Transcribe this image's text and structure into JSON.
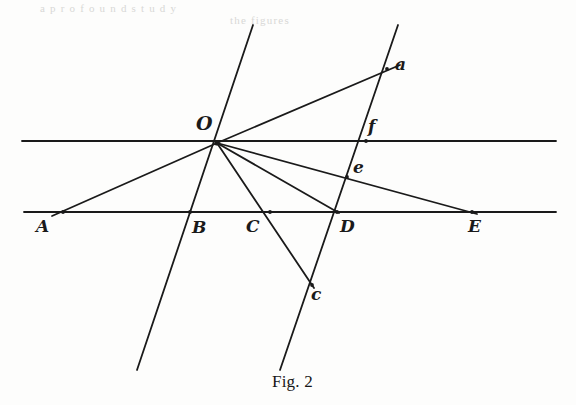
{
  "figure": {
    "caption": "Fig. 2",
    "caption_x": 272,
    "caption_y": 372,
    "width": 576,
    "height": 405,
    "background_color": "#fdfdfc",
    "ink_color": "#1a1a1a",
    "stroke_width": 1.8
  },
  "bleed_text": {
    "line1": "a  p  r  o  f  o  u  n  d     s  t  u  d  y",
    "line1_x": 40,
    "line1_y": 2,
    "line2": "the  figures",
    "line2_x": 230,
    "line2_y": 14
  },
  "points": [
    {
      "name": "O",
      "label": "O",
      "x": 217,
      "y": 143,
      "label_x": 196,
      "label_y": 114,
      "size": "upper"
    },
    {
      "name": "A",
      "label": "A",
      "x": 63,
      "y": 212,
      "label_x": 36,
      "label_y": 218,
      "size": "lower"
    },
    {
      "name": "B",
      "label": "B",
      "x": 190,
      "y": 212,
      "label_x": 192,
      "label_y": 219,
      "size": "lower"
    },
    {
      "name": "C",
      "label": "C",
      "x": 270,
      "y": 212,
      "label_x": 246,
      "label_y": 218,
      "size": "lower"
    },
    {
      "name": "D",
      "label": "D",
      "x": 337,
      "y": 212,
      "label_x": 340,
      "label_y": 218,
      "size": "lower"
    },
    {
      "name": "E",
      "label": "E",
      "x": 472,
      "y": 212,
      "label_x": 468,
      "label_y": 218,
      "size": "lower"
    },
    {
      "name": "a",
      "label": "a",
      "x": 387,
      "y": 69,
      "label_x": 395,
      "label_y": 56,
      "size": "lower"
    },
    {
      "name": "f",
      "label": "f",
      "x": 366,
      "y": 141,
      "label_x": 368,
      "label_y": 118,
      "size": "lower"
    },
    {
      "name": "e",
      "label": "e",
      "x": 347,
      "y": 177,
      "label_x": 353,
      "label_y": 159,
      "size": "lower"
    },
    {
      "name": "c",
      "label": "c",
      "x": 312,
      "y": 285,
      "label_x": 311,
      "label_y": 286,
      "size": "lower"
    }
  ],
  "lines": [
    {
      "name": "upper-horizontal-line",
      "x1": 22,
      "y1": 141,
      "x2": 556,
      "y2": 141
    },
    {
      "name": "lower-horizontal-line",
      "x1": 24,
      "y1": 212,
      "x2": 556,
      "y2": 212
    },
    {
      "name": "transversal-line-through-B",
      "x1": 253,
      "y1": 25,
      "x2": 137,
      "y2": 370
    },
    {
      "name": "transversal-line-through-D",
      "x1": 398,
      "y1": 25,
      "x2": 280,
      "y2": 370
    },
    {
      "name": "ray-O-to-a",
      "x1": 217,
      "y1": 143,
      "x2": 400,
      "y2": 65
    },
    {
      "name": "ray-O-to-E",
      "x1": 217,
      "y1": 143,
      "x2": 477,
      "y2": 214
    },
    {
      "name": "ray-O-to-D",
      "x1": 217,
      "y1": 143,
      "x2": 339,
      "y2": 213
    },
    {
      "name": "ray-O-through-C-to-c",
      "x1": 217,
      "y1": 143,
      "x2": 314,
      "y2": 288
    },
    {
      "name": "ray-O-to-A",
      "x1": 217,
      "y1": 143,
      "x2": 52,
      "y2": 216
    }
  ],
  "geometry_notes": {
    "pencil_vertex": "O",
    "parallel_lines": [
      "upper-horizontal-line",
      "lower-horizontal-line"
    ],
    "transversals": [
      "transversal-line-through-B",
      "transversal-line-through-D"
    ],
    "base_points": [
      "A",
      "B",
      "C",
      "D",
      "E"
    ],
    "secondary_points": [
      "a",
      "f",
      "e",
      "c"
    ]
  }
}
